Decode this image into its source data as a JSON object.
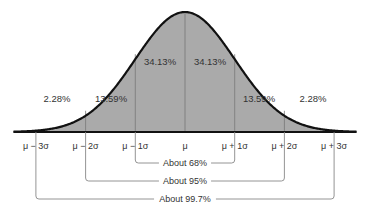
{
  "chart_data": {
    "type": "area",
    "title": "",
    "colors": {
      "fill": "#aaaaaa",
      "curve": "#111111",
      "divider": "#777777",
      "bracket": "#888888",
      "text": "#333333"
    },
    "x_ticks": [
      "μ − 3σ",
      "μ − 2σ",
      "μ − 1σ",
      "μ",
      "μ + 1σ",
      "μ + 2σ",
      "μ + 3σ"
    ],
    "x_range_sigma": [
      -3,
      3
    ],
    "regions": [
      {
        "from": -3.6,
        "to": -2,
        "label": "2.28%",
        "outside_curve": true
      },
      {
        "from": -2,
        "to": -1,
        "label": "13.59%"
      },
      {
        "from": -1,
        "to": 0,
        "label": "34.13%"
      },
      {
        "from": 0,
        "to": 1,
        "label": "34.13%"
      },
      {
        "from": 1,
        "to": 2,
        "label": "13.59%"
      },
      {
        "from": 2,
        "to": 3.6,
        "label": "2.28%",
        "outside_curve": true
      }
    ],
    "brackets": [
      {
        "from": -1,
        "to": 1,
        "label": "About 68%"
      },
      {
        "from": -2,
        "to": 2,
        "label": "About 95%"
      },
      {
        "from": -3,
        "to": 3,
        "label": "About 99.7%"
      }
    ]
  }
}
